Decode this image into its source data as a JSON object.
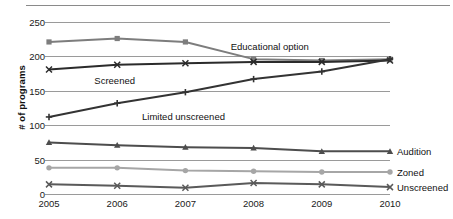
{
  "chart_data": {
    "type": "line",
    "title": "",
    "xlabel": "",
    "ylabel": "# of programs",
    "categories": [
      "2005",
      "2006",
      "2007",
      "2008",
      "2009",
      "2010"
    ],
    "x": [
      2005,
      2006,
      2007,
      2008,
      2009,
      2010
    ],
    "ylim": [
      0,
      250
    ],
    "yticks": [
      0,
      50,
      100,
      150,
      200,
      250
    ],
    "ytick_labels": [
      "0",
      "50",
      "100",
      "150",
      "200",
      "250"
    ],
    "grid": true,
    "legend_position": "inline-and-right-edge",
    "series": [
      {
        "name": "Educational option",
        "values": [
          221,
          226,
          221,
          196,
          194,
          196
        ],
        "color": "#7d7d7d",
        "marker": "square",
        "label_placement": "inline",
        "label_x_pct": 53,
        "label_y_pct": 11
      },
      {
        "name": "Screened",
        "values": [
          181,
          188,
          190,
          192,
          192,
          194
        ],
        "color": "#2b2b2b",
        "marker": "x",
        "label_placement": "inline",
        "label_x_pct": 13,
        "label_y_pct": 31
      },
      {
        "name": "Limited unscreened",
        "values": [
          112,
          132,
          148,
          167,
          178,
          196
        ],
        "color": "#333333",
        "marker": "plus",
        "label_placement": "inline",
        "label_x_pct": 27,
        "label_y_pct": 52
      },
      {
        "name": "Audition",
        "values": [
          75,
          71,
          68,
          67,
          62,
          62
        ],
        "color": "#4d4d4d",
        "marker": "triangle",
        "label_placement": "right",
        "label_value": 62
      },
      {
        "name": "Zoned",
        "values": [
          38,
          38,
          34,
          33,
          32,
          32
        ],
        "color": "#a6a6a6",
        "marker": "circle",
        "label_placement": "right",
        "label_value": 32
      },
      {
        "name": "Unscreened",
        "values": [
          14,
          12,
          9,
          16,
          14,
          10
        ],
        "color": "#5a5a5a",
        "marker": "x",
        "label_placement": "right",
        "label_value": 10
      }
    ]
  }
}
